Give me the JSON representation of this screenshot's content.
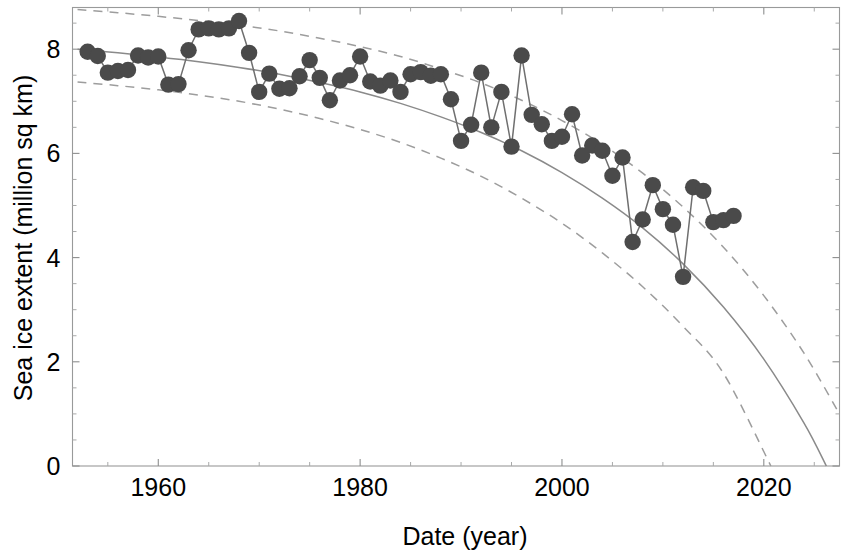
{
  "chart_data": {
    "type": "scatter",
    "title": "",
    "xlabel": "Date (year)",
    "ylabel": "Sea ice extent (million sq km)",
    "xlim": [
      1951.5,
      2027.5
    ],
    "ylim": [
      0,
      8.8
    ],
    "xticks": [
      1960,
      1980,
      2000,
      2020
    ],
    "xticklabels": [
      "1960",
      "1980",
      "2000",
      "2020"
    ],
    "yticks": [
      0,
      2,
      4,
      6,
      8
    ],
    "yticklabels": [
      "0",
      "2",
      "4",
      "6",
      "8"
    ],
    "xtick_minor_step": 5,
    "ytick_minor_step": 0.5,
    "grid": false,
    "legend": false,
    "marker_color": "#4a4a4a",
    "line_color": "#6f6f6f",
    "fit_color": "#8a8a8a",
    "ci_color": "#9d9d9d",
    "series": [
      {
        "name": "Observed September sea ice extent",
        "style": "markers-with-connecting-line",
        "x": [
          1953,
          1954,
          1955,
          1956,
          1957,
          1958,
          1959,
          1960,
          1961,
          1962,
          1963,
          1964,
          1965,
          1966,
          1967,
          1968,
          1969,
          1970,
          1971,
          1972,
          1973,
          1974,
          1975,
          1976,
          1977,
          1978,
          1979,
          1980,
          1981,
          1982,
          1983,
          1984,
          1985,
          1986,
          1987,
          1988,
          1989,
          1990,
          1991,
          1992,
          1993,
          1994,
          1995,
          1996,
          1997,
          1998,
          1999,
          2000,
          2001,
          2002,
          2003,
          2004,
          2005,
          2006,
          2007,
          2008,
          2009,
          2010,
          2011,
          2012,
          2013,
          2014,
          2015,
          2016,
          2017
        ],
        "y": [
          7.95,
          7.87,
          7.55,
          7.58,
          7.6,
          7.88,
          7.84,
          7.86,
          7.32,
          7.33,
          7.98,
          8.38,
          8.4,
          8.38,
          8.4,
          8.54,
          7.93,
          7.18,
          7.53,
          7.24,
          7.25,
          7.48,
          7.79,
          7.45,
          7.02,
          7.4,
          7.5,
          7.86,
          7.38,
          7.3,
          7.4,
          7.18,
          7.52,
          7.56,
          7.49,
          7.52,
          7.04,
          6.24,
          6.55,
          7.55,
          6.5,
          7.18,
          6.13,
          7.88,
          6.74,
          6.56,
          6.24,
          6.32,
          6.75,
          5.96,
          6.15,
          6.05,
          5.57,
          5.92,
          4.3,
          4.73,
          5.39,
          4.93,
          4.63,
          3.63,
          5.35,
          5.28,
          4.68,
          4.72,
          4.8
        ]
      }
    ],
    "fit_curve": {
      "name": "Quadratic trend fit",
      "style": "solid",
      "x": [
        1952,
        1956,
        1960,
        1964,
        1968,
        1972,
        1976,
        1980,
        1984,
        1988,
        1992,
        1996,
        2000,
        2004,
        2008,
        2012,
        2016,
        2020,
        2024,
        2026.2
      ],
      "y": [
        8.0,
        7.93,
        7.85,
        7.76,
        7.65,
        7.52,
        7.36,
        7.18,
        6.96,
        6.7,
        6.4,
        6.05,
        5.63,
        5.14,
        4.57,
        3.88,
        3.05,
        2.05,
        0.82,
        0.0
      ]
    },
    "confidence_upper": {
      "name": "Upper confidence bound",
      "style": "dashed",
      "x": [
        1952,
        1956,
        1960,
        1964,
        1968,
        1972,
        1976,
        1980,
        1984,
        1988,
        1992,
        1996,
        2000,
        2004,
        2008,
        2012,
        2016,
        2020,
        2024,
        2027.5
      ],
      "y": [
        8.76,
        8.7,
        8.63,
        8.55,
        8.46,
        8.35,
        8.21,
        8.05,
        7.86,
        7.62,
        7.35,
        7.02,
        6.63,
        6.17,
        5.62,
        4.97,
        4.2,
        3.27,
        2.16,
        1.0
      ]
    },
    "confidence_lower": {
      "name": "Lower confidence bound",
      "style": "dashed",
      "x": [
        1952,
        1956,
        1960,
        1964,
        1968,
        1972,
        1976,
        1980,
        1984,
        1988,
        1992,
        1996,
        2000,
        2004,
        2008,
        2012,
        2016,
        2020.7
      ],
      "y": [
        7.37,
        7.3,
        7.22,
        7.12,
        7.0,
        6.85,
        6.67,
        6.46,
        6.21,
        5.91,
        5.56,
        5.14,
        4.66,
        4.09,
        3.44,
        2.68,
        1.78,
        0.0
      ]
    }
  },
  "axes": {
    "xlabel": "Date (year)",
    "ylabel": "Sea ice extent (million sq km)"
  }
}
